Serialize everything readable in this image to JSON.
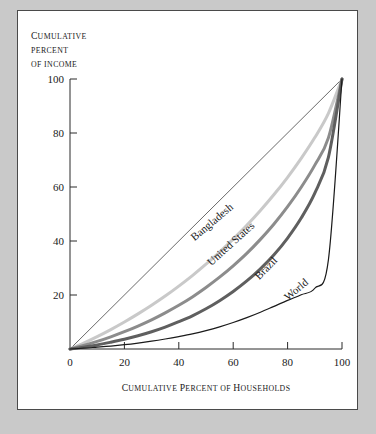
{
  "figure": {
    "background_color": "#c9c9c9",
    "panel_color": "#ffffff",
    "panel_border_color": "#4a4a4a"
  },
  "chart_data": {
    "type": "line",
    "title": "",
    "subtitle": "",
    "ylabel_lines": [
      "Cumulative",
      "percent",
      "of income"
    ],
    "ylabel": "CUMULATIVE PERCENT OF INCOME",
    "xlabel": "CUMULATIVE PERCENT OF HOUSEHOLDS",
    "xlabel_parts": {
      "lead1": "C",
      "rest1": "UMULATIVE",
      "lead2": "P",
      "rest2": "ERCENT OF",
      "lead3": "H",
      "rest3": "OUSEHOLDS"
    },
    "ylabel_parts": {
      "lead": "C",
      "rest": "UMULATIVE",
      "line2": "PERCENT",
      "line3": "OF INCOME"
    },
    "xlim": [
      0,
      100
    ],
    "ylim": [
      0,
      100
    ],
    "xticks": [
      0,
      20,
      40,
      60,
      80,
      100
    ],
    "yticks": [
      0,
      20,
      40,
      60,
      80,
      100
    ],
    "xtick_labels": [
      "0",
      "20",
      "40",
      "60",
      "80",
      "100"
    ],
    "ytick_labels": [
      "20",
      "40",
      "60",
      "80",
      "100"
    ],
    "grid": false,
    "legend_position": "inline-curve-labels",
    "tick_direction": "in",
    "x": [
      0,
      5,
      10,
      15,
      20,
      25,
      30,
      35,
      40,
      45,
      50,
      55,
      60,
      65,
      70,
      75,
      80,
      85,
      90,
      95,
      100
    ],
    "series": [
      {
        "name": "Line of equality",
        "label": "",
        "color": "#2a2a2a",
        "width": 0.7,
        "values": [
          0,
          5,
          10,
          15,
          20,
          25,
          30,
          35,
          40,
          45,
          50,
          55,
          60,
          65,
          70,
          75,
          80,
          85,
          90,
          95,
          100
        ]
      },
      {
        "name": "Bangladesh",
        "label": "Bangladesh",
        "color": "#c9c9c9",
        "width": 3.0,
        "label_x": 53,
        "label_y": 46,
        "label_angle": -40,
        "values": [
          0,
          2.2,
          4.6,
          7.2,
          10.0,
          13.0,
          16.2,
          19.6,
          23.3,
          27.2,
          31.4,
          35.9,
          40.7,
          45.8,
          51.3,
          57.2,
          63.6,
          70.6,
          78.3,
          87.3,
          100
        ]
      },
      {
        "name": "United States",
        "label": "United States",
        "color": "#8c8c8c",
        "width": 3.0,
        "label_x": 60,
        "label_y": 38,
        "label_angle": -42,
        "values": [
          0,
          1.3,
          2.8,
          4.5,
          6.4,
          8.5,
          10.8,
          13.4,
          16.2,
          19.3,
          22.8,
          26.6,
          30.8,
          35.4,
          40.6,
          46.3,
          52.7,
          59.9,
          68.1,
          78.2,
          100
        ]
      },
      {
        "name": "Brazil",
        "label": "Brazil",
        "color": "#5f5f5f",
        "width": 3.0,
        "label_x": 73,
        "label_y": 29,
        "label_angle": -46,
        "values": [
          0,
          0.7,
          1.5,
          2.5,
          3.6,
          4.9,
          6.4,
          8.1,
          10.1,
          12.3,
          14.9,
          17.9,
          21.3,
          25.2,
          29.7,
          34.9,
          41.1,
          48.5,
          57.7,
          71.0,
          100
        ]
      },
      {
        "name": "World",
        "label": "World",
        "color": "#1a1a1a",
        "width": 1.2,
        "label_x": 84,
        "label_y": 21,
        "label_angle": -40,
        "values": [
          0,
          0.3,
          0.7,
          1.1,
          1.6,
          2.2,
          2.9,
          3.7,
          4.6,
          5.6,
          6.8,
          8.2,
          9.8,
          11.6,
          13.6,
          15.8,
          18.0,
          20.1,
          22.5,
          33.0,
          100
        ]
      }
    ]
  }
}
